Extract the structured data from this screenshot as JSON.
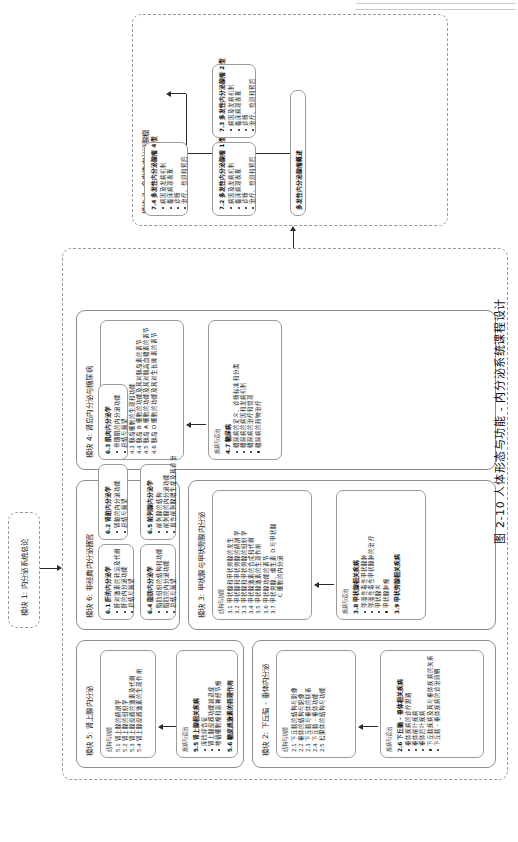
{
  "figure": {
    "caption": "图 2-10  人体形态与功能 - 内分泌系统课程设计"
  },
  "labels": {
    "structure_function": "结构与功能",
    "disease_diagnosis": "疾病与诊治"
  },
  "module1": {
    "label": "模块 1:  内分泌系统总论"
  },
  "module2": {
    "label": "模块 2:  下丘脑 - 垂体内分泌",
    "structure": {
      "head": "结构与功能",
      "items": [
        {
          "num": "2.1",
          "text": "下丘脑的结构与影像"
        },
        {
          "num": "2.2",
          "text": "垂体的结构与影像"
        },
        {
          "num": "2.3",
          "text": "下丘脑与垂体的联系"
        },
        {
          "num": "2.4",
          "text": "下丘脑 - 垂体功能"
        },
        {
          "num": "2.5",
          "text": "松果体的结构与功能"
        }
      ]
    },
    "disease": {
      "head": "疾病与诊治",
      "sub": "2.6  下丘脑 - 垂体相关疾病",
      "items": [
        "垂体疾病的诊疗思路",
        "垂体前叶疾病",
        "垂体后叶疾病",
        "下丘脑疾病及其与垂体疾病的关系",
        "下丘脑 - 垂体疾病的诊治原则"
      ]
    }
  },
  "module3": {
    "label": "模块 3:  甲状腺与甲状旁腺内分泌",
    "structure": {
      "head": "结构与功能",
      "items": [
        {
          "num": "3.1",
          "text": "甲状腺和甲状旁腺的发生"
        },
        {
          "num": "3.2",
          "text": "甲状腺和甲状旁腺的解剖学"
        },
        {
          "num": "3.3",
          "text": "甲状腺和甲状旁腺的组织学"
        },
        {
          "num": "3.4",
          "text": "甲状腺激素的合成和代谢"
        },
        {
          "num": "3.5",
          "text": "甲状腺激素的生理作用"
        },
        {
          "num": "3.6",
          "text": "甲状腺功能的调节"
        },
        {
          "num": "3.7",
          "text": "甲状旁腺、维生素 D 与甲状腺"
        },
        {
          "num": "",
          "text": "C 细胞的内分泌",
          "cont": true
        }
      ]
    },
    "disease": {
      "head": "疾病与诊治",
      "sub": "3.8  甲状腺相关疾病",
      "items": [
        "弥漫性毒性甲状腺肿",
        "弥漫性毒性甲状腺肿的治疗",
        "甲状腺炎",
        "甲状腺肿瘤"
      ],
      "sub2": "3.9  甲状旁腺相关疾病"
    }
  },
  "module4": {
    "label": "模块 4:  肾岛内分泌与糖尿病",
    "structure": {
      "head": "结构与功能",
      "items": [
        {
          "num": "4.1",
          "text": "胰岛发生和形态"
        },
        {
          "num": "4.2",
          "text": "胰岛 A 细胞和形态"
        },
        {
          "num": "4.3",
          "text": "胰岛细胞的生理和功能"
        },
        {
          "num": "4.4",
          "text": "胰岛 B 细胞的功能及其对胰岛素的调节"
        },
        {
          "num": "4.5",
          "text": "胰岛 A 细胞的功能及其对胰高血糖素的调节"
        },
        {
          "num": "4.6",
          "text": "胰岛 D 细胞的功能及其对生长抑素的调节"
        }
      ]
    },
    "disease": {
      "head": "疾病与诊治",
      "sub": "4.7  糖尿病",
      "items": [
        "糖尿病的定义、诊断标准和分类",
        "糖尿病的病因和发病机制",
        "糖尿病的治疗和管理",
        "糖尿病的药物治疗"
      ]
    }
  },
  "module5": {
    "label": "模块 5:  肾上腺内分泌",
    "structure": {
      "head": "结构与功能",
      "items": [
        {
          "num": "5.1",
          "text": "肾上腺的解剖学"
        },
        {
          "num": "5.2",
          "text": "肾上腺的组织学"
        },
        {
          "num": "5.3",
          "text": "肾上腺皮质的激素及代谢"
        },
        {
          "num": "5.4",
          "text": "肾上腺皮质激素的生理作用"
        }
      ]
    },
    "disease": {
      "head": "疾病与诊治",
      "sub": "5.5  肾上腺相关疾病",
      "items": [
        "库欣综合征",
        "肾上腺皮质功能减退症",
        "嗜铬细胞瘤和副神经节瘤"
      ],
      "sub2": "5.6  糖皮质激素的药理作用"
    }
  },
  "module6": {
    "label": "模块 6:  非经典内分泌器官",
    "cards": [
      {
        "sub": "6.1  肝的内分泌学",
        "items": [
          "肝对激素的转运及代谢",
          "肝的内分泌功能",
          "总结与展望"
        ]
      },
      {
        "sub": "6.2  肾脏内分泌学",
        "items": [
          "肾脏的内分泌功能",
          "总结与展望"
        ]
      },
      {
        "sub": "6.3  肌肉内分泌学",
        "items": [
          "骨骼肌的内分泌功能",
          "总结与展望"
        ]
      },
      {
        "sub": "6.4  脂肪内分泌学",
        "items": [
          "脂肪组织的结构和功能",
          "脂肪的内分泌功能",
          "总结与展望"
        ]
      },
      {
        "sub": "6.5  前列腺内分泌学",
        "items": [
          "前列腺的结构",
          "前列腺的内分泌功能",
          "良性前列腺增生症及其诊治"
        ]
      }
    ]
  },
  "module7": {
    "label": "模块 7:  多发性内分泌腺瘤",
    "hub": "多发性内分泌腺瘤概述",
    "cards": [
      {
        "sub": "7.2  多发性内分泌腺瘤 1 型",
        "items": [
          "病因及发病机制",
          "临床病理表现",
          "诊断",
          "治疗、检测和预后"
        ]
      },
      {
        "sub": "7.3  多发性内分泌腺瘤 2 型",
        "items": [
          "病因及发病机制",
          "临床病理表现",
          "诊断",
          "治疗、检测和预后"
        ]
      },
      {
        "sub": "7.4  多发性内分泌腺瘤 4 型",
        "items": [
          "病因及发病机制",
          "临床病理表现",
          "诊断",
          "治疗、检测和预后"
        ]
      }
    ]
  }
}
